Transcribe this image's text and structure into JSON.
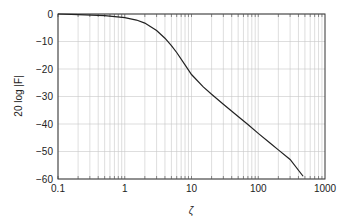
{
  "chart_data": {
    "type": "line",
    "title": "",
    "xlabel": "ζ",
    "ylabel": "20 log |F|",
    "xscale": "log",
    "xlim": [
      0.1,
      1000
    ],
    "ylim": [
      -60,
      0
    ],
    "grid": true,
    "legend": null,
    "x_ticks": [
      "0.1",
      "1",
      "10",
      "100",
      "1000"
    ],
    "y_ticks": [
      "0",
      "−10",
      "−20",
      "−30",
      "−40",
      "−50",
      "−60"
    ],
    "series": [
      {
        "name": "20 log |F|",
        "color": "#222222",
        "x": [
          0.1,
          0.2,
          0.5,
          1,
          1.5,
          2,
          3,
          4,
          5,
          6,
          8,
          10,
          15,
          20,
          30,
          50,
          70,
          100,
          150,
          200,
          300,
          470
        ],
        "y": [
          0,
          -0.2,
          -0.6,
          -1.3,
          -2.2,
          -3.3,
          -6,
          -8.8,
          -11.5,
          -14,
          -18.5,
          -22,
          -26.5,
          -29.2,
          -32.8,
          -37.3,
          -40.2,
          -43.4,
          -46.9,
          -49.4,
          -52.9,
          -59
        ]
      }
    ]
  }
}
